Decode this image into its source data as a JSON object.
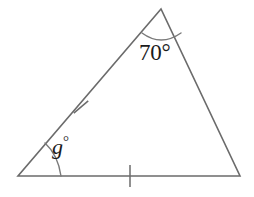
{
  "figure": {
    "kind": "geometry-diagram",
    "shape": "triangle",
    "background_color": "#ffffff",
    "stroke_color": "#6b6b6b",
    "text_color": "#1b1b1b",
    "stroke_width": 1.6
  },
  "triangle": {
    "name": "isosceles-triangle",
    "vertices": {
      "apex": {
        "label": "apex-vertex",
        "x": 161,
        "y": 9
      },
      "bottom_left": {
        "label": "bottom-left-vertex",
        "x": 18,
        "y": 176
      },
      "bottom_right": {
        "label": "bottom-right-vertex",
        "x": 240,
        "y": 176
      }
    },
    "sides": [
      {
        "name": "left-side",
        "from": "bottom_left",
        "to": "apex",
        "tick_marks": 1
      },
      {
        "name": "base-side",
        "from": "bottom_left",
        "to": "bottom_right",
        "tick_marks": 1
      },
      {
        "name": "right-side",
        "from": "apex",
        "to": "bottom_right",
        "tick_marks": 0
      }
    ],
    "path": "M 161 9 L 18 176 L 240 176 Z"
  },
  "angles": [
    {
      "name": "apex-angle",
      "at_vertex": "apex",
      "value": 70,
      "label": "70°",
      "has_arc": true,
      "arc_path": "M 142 33 Q 161 47 181 33"
    },
    {
      "name": "unknown-angle-g",
      "at_vertex": "bottom_left",
      "value": null,
      "label": "g",
      "label_suffix": "°",
      "has_arc": true,
      "arc_path": "M 61 176 Q 58 155 45 143"
    }
  ],
  "tick_marks": [
    {
      "name": "left-side-tick",
      "x": 81,
      "y": 107,
      "rotation_deg": 49.4,
      "length": 19
    },
    {
      "name": "base-side-tick",
      "x": 130,
      "y": 176,
      "rotation_deg": 0,
      "length": 22
    }
  ]
}
